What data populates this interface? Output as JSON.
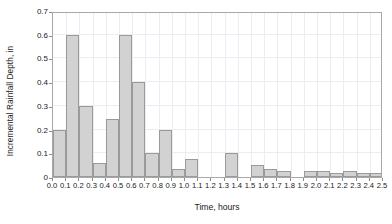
{
  "chart_data": {
    "type": "bar",
    "title": "",
    "subtitle": "",
    "xlabel": "Time, hours",
    "ylabel": "Incremental Rainfall Depth, in",
    "xlim": [
      0.0,
      2.5
    ],
    "ylim": [
      0.0,
      0.7
    ],
    "grid": true,
    "legend": null,
    "bar_style": {
      "fill": "#d2d2d2",
      "edge": "#9a9a9a",
      "width_fraction": 1.0
    },
    "axis_color": "#a8a8a8",
    "grid_color": "#ececf2",
    "xtick_labels": [
      "0.0",
      "0.1",
      "0.2",
      "0.3",
      "0.4",
      "0.5",
      "0.6",
      "0.7",
      "0.8",
      "0.9",
      "1.0",
      "1.1",
      "1.2",
      "1.3",
      "1.4",
      "1.5",
      "1.6",
      "1.7",
      "1.8",
      "1.9",
      "2.0",
      "2.1",
      "2.2",
      "2.3",
      "2.4",
      "2.5"
    ],
    "xtick_values": [
      0.0,
      0.1,
      0.2,
      0.3,
      0.4,
      0.5,
      0.6,
      0.7,
      0.8,
      0.9,
      1.0,
      1.1,
      1.2,
      1.3,
      1.4,
      1.5,
      1.6,
      1.7,
      1.8,
      1.9,
      2.0,
      2.1,
      2.2,
      2.3,
      2.4,
      2.5
    ],
    "ytick_labels": [
      "0",
      "0.1",
      "0.2",
      "0.3",
      "0.4",
      "0.5",
      "0.6",
      "0.7"
    ],
    "ytick_values": [
      0.0,
      0.1,
      0.2,
      0.3,
      0.4,
      0.5,
      0.6,
      0.7
    ],
    "bin_width": 0.1,
    "bin_starts": [
      0.0,
      0.1,
      0.2,
      0.3,
      0.4,
      0.5,
      0.6,
      0.7,
      0.8,
      0.9,
      1.0,
      1.1,
      1.2,
      1.3,
      1.4,
      1.5,
      1.6,
      1.7,
      1.8,
      1.9,
      2.0,
      2.1,
      2.2,
      2.3,
      2.4
    ],
    "values": [
      0.2,
      0.6,
      0.3,
      0.06,
      0.245,
      0.6,
      0.4,
      0.1,
      0.2,
      0.035,
      0.075,
      0.0,
      0.0,
      0.1,
      0.0,
      0.05,
      0.035,
      0.025,
      0.0,
      0.025,
      0.025,
      0.015,
      0.025,
      0.015,
      0.015
    ]
  }
}
